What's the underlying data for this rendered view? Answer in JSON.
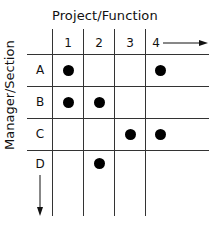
{
  "diagram": {
    "x_axis_title": "Project/Function",
    "y_axis_title": "Manager/Section",
    "columns": [
      "1",
      "2",
      "3",
      "4"
    ],
    "rows": [
      "A",
      "B",
      "C",
      "D"
    ],
    "cells": [
      {
        "row": "A",
        "column": "1",
        "marked": true
      },
      {
        "row": "A",
        "column": "4",
        "marked": true
      },
      {
        "row": "B",
        "column": "1",
        "marked": true
      },
      {
        "row": "B",
        "column": "2",
        "marked": true
      },
      {
        "row": "C",
        "column": "3",
        "marked": true
      },
      {
        "row": "C",
        "column": "4",
        "marked": true
      },
      {
        "row": "D",
        "column": "2",
        "marked": true
      }
    ],
    "x_direction_arrow": "right-arrow",
    "y_direction_arrow": "down-arrow"
  }
}
